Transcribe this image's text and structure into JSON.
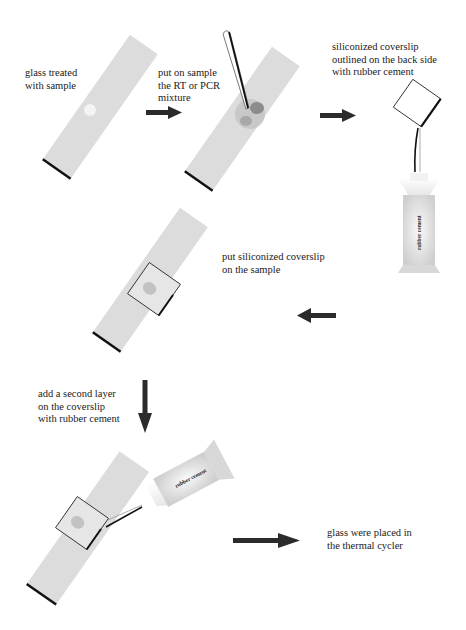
{
  "diagram": {
    "type": "procedure-flow",
    "colors": {
      "background": "#ffffff",
      "slide": "#dcdcdc",
      "slide_edge": "#111111",
      "arrow": "#2b2b2b",
      "text": "#1a1a1a",
      "sample_outer": "#c4c4c4",
      "sample_dark": "#8c8c8c",
      "sample_mid": "#a8a8a8",
      "tube_body": "#d6d6d6"
    },
    "steps": [
      {
        "id": "step1",
        "lines": [
          "glass treated",
          "with sample"
        ]
      },
      {
        "id": "step2",
        "lines": [
          "put on sample",
          "the RT or PCR",
          "mixture"
        ]
      },
      {
        "id": "step3",
        "lines": [
          "siliconized coverslip",
          "outlined on the back side",
          "with rubber cement"
        ]
      },
      {
        "id": "step4",
        "lines": [
          "put siliconized coverslip",
          "on the sample"
        ]
      },
      {
        "id": "step5",
        "lines": [
          "add a second layer",
          "on the coverslip",
          "with rubber cement"
        ]
      },
      {
        "id": "step6",
        "lines": [
          "glass were placed in",
          "the thermal cycler"
        ]
      }
    ],
    "tube_labels": [
      "rubber cement",
      "rubber cement"
    ],
    "arrows": [
      {
        "from": "step1",
        "to": "step2",
        "direction": "right"
      },
      {
        "from": "step2",
        "to": "step3",
        "direction": "right"
      },
      {
        "from": "step3",
        "to": "step4",
        "direction": "left"
      },
      {
        "from": "step4",
        "to": "step5",
        "direction": "down"
      },
      {
        "from": "step5",
        "to": "step6",
        "direction": "right"
      }
    ]
  }
}
